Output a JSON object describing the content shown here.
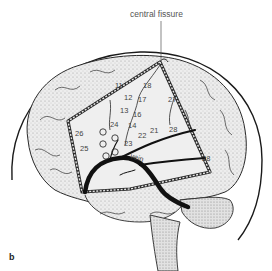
{
  "figure": {
    "panel_label": "b",
    "callout": "central fissure",
    "vessel_label": "vein",
    "stimulation_points": [
      {
        "label": "11",
        "x": 118,
        "y": 85
      },
      {
        "label": "18",
        "x": 143,
        "y": 86
      },
      {
        "label": "12",
        "x": 126,
        "y": 97
      },
      {
        "label": "17",
        "x": 140,
        "y": 100
      },
      {
        "label": "27",
        "x": 170,
        "y": 99
      },
      {
        "label": "13",
        "x": 121,
        "y": 109
      },
      {
        "label": "16",
        "x": 136,
        "y": 113
      },
      {
        "label": "24",
        "x": 113,
        "y": 124
      },
      {
        "label": "14",
        "x": 130,
        "y": 125
      },
      {
        "label": "21",
        "x": 152,
        "y": 130
      },
      {
        "label": "28",
        "x": 171,
        "y": 129
      },
      {
        "label": "26",
        "x": 77,
        "y": 133
      },
      {
        "label": "22",
        "x": 140,
        "y": 135
      },
      {
        "label": "23",
        "x": 126,
        "y": 143
      },
      {
        "label": "25",
        "x": 83,
        "y": 148
      },
      {
        "label": "28",
        "x": 203,
        "y": 158
      }
    ],
    "circle_markers": [
      {
        "x": 103,
        "y": 132
      },
      {
        "x": 115,
        "y": 138
      },
      {
        "x": 103,
        "y": 144
      },
      {
        "x": 115,
        "y": 152
      },
      {
        "x": 106,
        "y": 156
      }
    ],
    "colors": {
      "outline": "#1a1a1a",
      "stipple": "#cfcfcf",
      "label_text": "#444444",
      "vein": "#111111"
    }
  }
}
